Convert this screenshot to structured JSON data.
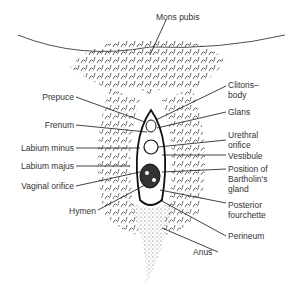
{
  "diagram": {
    "labels_left": [
      {
        "id": "prepuce",
        "text": "Prepuce"
      },
      {
        "id": "frenum",
        "text": "Frenum"
      },
      {
        "id": "labium-minus",
        "text": "Labium minus"
      },
      {
        "id": "labium-majus",
        "text": "Labium majus"
      },
      {
        "id": "vaginal-orifice",
        "text": "Vaginal orifice"
      },
      {
        "id": "hymen",
        "text": "Hymen"
      }
    ],
    "labels_top": [
      {
        "id": "mons-pubis",
        "text": "Mons pubis"
      }
    ],
    "labels_right": [
      {
        "id": "clitoris-body",
        "line1": "Clitoris–",
        "line2": "body"
      },
      {
        "id": "glans",
        "text": "Glans"
      },
      {
        "id": "urethral-orifice",
        "line1": "Urethral",
        "line2": "orifice"
      },
      {
        "id": "vestibule",
        "text": "Vestibule"
      },
      {
        "id": "bartholins-gland",
        "line1": "Position of",
        "line2": "Bartholin's",
        "line3": "gland"
      },
      {
        "id": "posterior-fourchette",
        "line1": "Posterior",
        "line2": "fourchette"
      },
      {
        "id": "perineum",
        "text": "Perineum"
      },
      {
        "id": "anus",
        "text": "Anus"
      }
    ]
  }
}
